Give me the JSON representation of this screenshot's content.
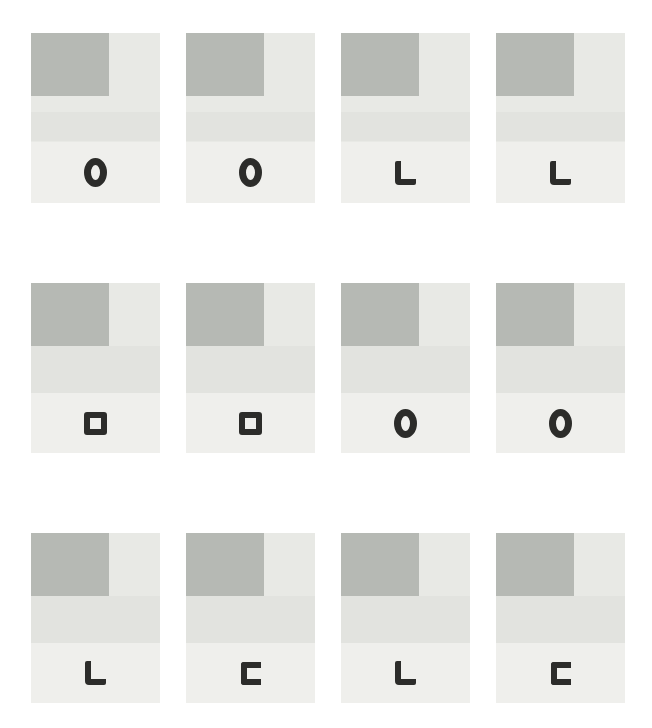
{
  "figure": {
    "description": "grid of experiment stimulus cards",
    "rows": 3,
    "cols": 4,
    "colors": {
      "page_bg": "#ffffff",
      "card_top": "#e8e9e5",
      "card_band": "#e2e3df",
      "card_bottom": "#efefec",
      "cue_rect": "#b6b9b4",
      "symbol": "#2c2c2a"
    },
    "cards": [
      {
        "row": 1,
        "col": 1,
        "symbol": "O"
      },
      {
        "row": 1,
        "col": 2,
        "symbol": "O"
      },
      {
        "row": 1,
        "col": 3,
        "symbol": "L"
      },
      {
        "row": 1,
        "col": 4,
        "symbol": "L"
      },
      {
        "row": 2,
        "col": 1,
        "symbol": "square"
      },
      {
        "row": 2,
        "col": 2,
        "symbol": "square"
      },
      {
        "row": 2,
        "col": 3,
        "symbol": "O"
      },
      {
        "row": 2,
        "col": 4,
        "symbol": "O"
      },
      {
        "row": 3,
        "col": 1,
        "symbol": "L"
      },
      {
        "row": 3,
        "col": 2,
        "symbol": "C"
      },
      {
        "row": 3,
        "col": 3,
        "symbol": "L"
      },
      {
        "row": 3,
        "col": 4,
        "symbol": "C"
      }
    ]
  }
}
